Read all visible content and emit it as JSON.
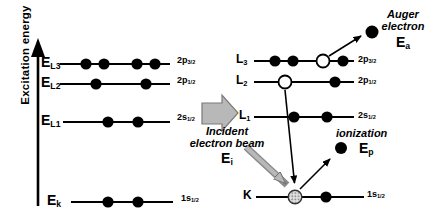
{
  "axis": {
    "label": "Excitation energy"
  },
  "left_levels": [
    {
      "symbol": "E",
      "subscript": "L3",
      "orbital": "2p",
      "orbital_sub": "3/2",
      "electrons": [
        "filled",
        "filled",
        "filled",
        "filled"
      ]
    },
    {
      "symbol": "E",
      "subscript": "L2",
      "orbital": "2p",
      "orbital_sub": "1/2",
      "electrons": [
        "filled",
        "filled"
      ]
    },
    {
      "symbol": "E",
      "subscript": "L1",
      "orbital": "2s",
      "orbital_sub": "1/2",
      "electrons": [
        "filled",
        "filled"
      ]
    },
    {
      "symbol": "E",
      "subscript": "k",
      "orbital": "1s",
      "orbital_sub": "1/2",
      "electrons": [
        "filled",
        "filled"
      ]
    }
  ],
  "right_levels": [
    {
      "symbol": "L",
      "subscript": "3",
      "orbital": "2p",
      "orbital_sub": "3/2",
      "electrons": [
        "filled",
        "filled",
        "vacancy",
        "filled"
      ]
    },
    {
      "symbol": "L",
      "subscript": "2",
      "orbital": "2p",
      "orbital_sub": "1/2",
      "electrons": [
        "vacancy",
        "filled"
      ]
    },
    {
      "symbol": "L",
      "subscript": "1",
      "orbital": "2s",
      "orbital_sub": "1/2",
      "electrons": [
        "filled",
        "filled"
      ]
    },
    {
      "symbol": "K",
      "subscript": "",
      "orbital": "1s",
      "orbital_sub": "1/2",
      "electrons": [
        "core-hole",
        "filled"
      ]
    }
  ],
  "annotations": {
    "auger": {
      "line1": "Auger",
      "line2": "electron",
      "symbol": "E",
      "subscript": "a"
    },
    "ionization": {
      "label": "ionization",
      "symbol": "E",
      "subscript": "p"
    },
    "incident": {
      "line1": "Incident",
      "line2": "electron beam",
      "symbol": "E",
      "subscript": "i"
    }
  },
  "colors": {
    "ink": "#000000",
    "beam_fill": "#b8b8b8",
    "beam_outline": "#777777",
    "core_hole_fill": "#e0e0e0"
  }
}
